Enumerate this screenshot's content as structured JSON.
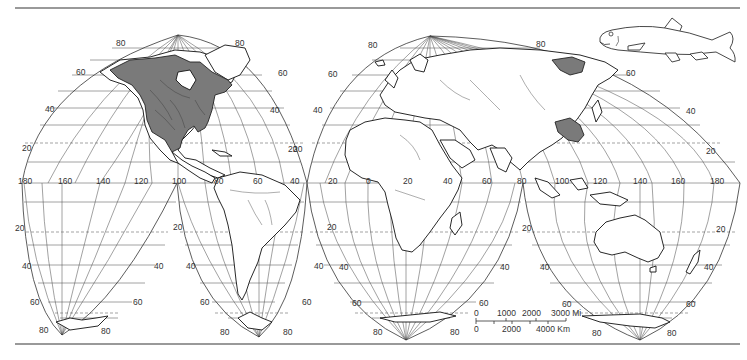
{
  "map": {
    "projection": "Interrupted homolosine world map",
    "shaded_regions": [
      {
        "name": "North America (Canada, USA, northern Mexico)",
        "color": "#7a7a7a"
      },
      {
        "name": "Eastern Siberia / Amur",
        "color": "#7a7a7a"
      },
      {
        "name": "Central China",
        "color": "#7a7a7a"
      }
    ],
    "latitude_labels": {
      "north_west_lobe": [
        "80",
        "60",
        "40",
        "20"
      ],
      "north_west_lobe_right": [
        "80",
        "60",
        "40",
        "20"
      ],
      "north_east_lobe_left": [
        "80",
        "60",
        "40",
        "20"
      ],
      "north_east_lobe_right": [
        "80",
        "60",
        "40",
        "20"
      ],
      "south_lobe_1_left": [
        "20",
        "40",
        "60",
        "80"
      ],
      "south_lobe_1_right": [
        "40",
        "60",
        "80"
      ],
      "south_lobe_2_left": [
        "20",
        "40",
        "60",
        "80"
      ],
      "south_lobe_2_right": [
        "40",
        "60",
        "80"
      ],
      "south_lobe_3_left": [
        "20",
        "40",
        "60",
        "80"
      ],
      "south_lobe_3_right": [
        "40",
        "60",
        "80"
      ],
      "south_lobe_4_left": [
        "20",
        "40",
        "60",
        "80"
      ],
      "south_lobe_4_right": [
        "20",
        "40",
        "60",
        "80"
      ]
    },
    "longitude_labels": [
      "180",
      "160",
      "140",
      "120",
      "100",
      "80",
      "60",
      "40",
      "20",
      "0",
      "20",
      "40",
      "60",
      "80",
      "100",
      "120",
      "140",
      "160",
      "180"
    ]
  },
  "labels": {
    "nw_80": "80",
    "nw_60": "60",
    "nw_40": "40",
    "nw_20": "20",
    "nwr_80": "80",
    "nwr_60": "60",
    "nwr_40": "40",
    "nwr_20": "20",
    "ne_80": "80",
    "ne_60": "60",
    "ne_40": "40",
    "ne_20": "20",
    "ner_80": "80",
    "ner_60": "60",
    "ner_40": "40",
    "ner_20": "20",
    "s1_20": "20",
    "s1_40": "40",
    "s1_60": "60",
    "s1_80": "80",
    "s1r_40": "40",
    "s1r_60": "60",
    "s1r_80": "80",
    "s2_20": "20",
    "s2_40": "40",
    "s2_60": "60",
    "s2_80": "80",
    "s2r_40": "40",
    "s2r_60": "60",
    "s2r_80": "80",
    "s3_20": "20",
    "s3_40": "40",
    "s3_60": "60",
    "s3_80": "80",
    "s3r_40": "40",
    "s3r_60": "60",
    "s3r_80": "80",
    "s4_20": "20",
    "s4_40": "40",
    "s4_60": "60",
    "s4_80": "80",
    "s4r_20": "20",
    "s4r_40": "40",
    "s4r_60": "60",
    "s4r_80": "80",
    "lon_180w": "180",
    "lon_160w": "160",
    "lon_140w": "140",
    "lon_120w": "120",
    "lon_100w": "100",
    "lon_80w": "80",
    "lon_60w": "60",
    "lon_40w": "40",
    "lon_40w_b": "40",
    "lon_20w": "20",
    "lon_0": "0",
    "lon_20e": "20",
    "lon_40e": "40",
    "lon_60e": "60",
    "lon_80e": "80",
    "lon_80e_b": "80",
    "lon_100e": "100",
    "lon_120e": "120",
    "lon_140e": "140",
    "lon_160e": "160",
    "lon_180e": "180"
  },
  "scale_bar": {
    "miles_ticks": [
      "0",
      "1000",
      "2000",
      "3000 Mi"
    ],
    "km_ticks": [
      "0",
      "2000",
      "4000 Km"
    ]
  },
  "illustration": {
    "subject": "fish (sucker / catostomid) line drawing"
  }
}
